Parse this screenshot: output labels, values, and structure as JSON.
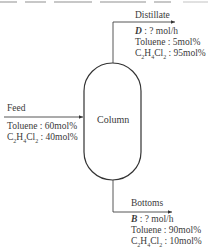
{
  "diagram": {
    "column": {
      "label": "Column"
    },
    "feed": {
      "label": "Feed",
      "toluene": "Toluene : 60mol%",
      "dce_formula": "C2H4Cl2",
      "dce": ": 40mol%"
    },
    "distillate": {
      "label": "Distillate",
      "symbol": "D",
      "flow": ": ? mol/h",
      "toluene": "Toluene : 5mol%",
      "dce": ": 95mol%"
    },
    "bottoms": {
      "label": "Bottoms",
      "symbol": "B",
      "flow": ": ? mol/h",
      "toluene": "Toluene : 90mol%",
      "dce": ": 10mol%"
    }
  }
}
